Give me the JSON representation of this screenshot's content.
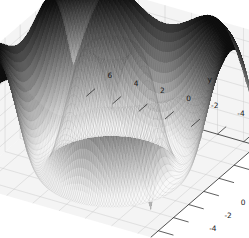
{
  "figure": {
    "name": "surface-plot-3d",
    "background_color": "#ffffff",
    "pane_color": "#f2f2f2",
    "grid_color": "#c8c8c8",
    "axis_line_color": "#1a1a1a",
    "colormap": "binary-grayscale"
  },
  "chart_data": {
    "type": "surface",
    "title": "",
    "xlabel": "x",
    "ylabel": "y",
    "zlabel": "z",
    "xlim": [
      -7,
      7
    ],
    "ylim": [
      -7,
      7
    ],
    "zlim": [
      -0.9,
      0.95
    ],
    "xticks": [
      "-6",
      "-4",
      "-2",
      "0",
      "2",
      "4",
      "6"
    ],
    "yticks": [
      "-6",
      "-4",
      "-2",
      "0",
      "2",
      "4",
      "6"
    ],
    "zticks": [
      "0.75",
      "0.50",
      "0.25",
      "0.00",
      "-0.25",
      "-0.50",
      "-0.75"
    ],
    "xtick_values": [
      -6,
      -4,
      -2,
      0,
      2,
      4,
      6
    ],
    "ytick_values": [
      -6,
      -4,
      -2,
      0,
      2,
      4,
      6
    ],
    "ztick_values": [
      0.75,
      0.5,
      0.25,
      0,
      -0.25,
      -0.5,
      -0.75
    ],
    "grid": true,
    "legend": null,
    "elevation_deg": 30,
    "azimuth_deg": -60,
    "function": "sin(sqrt(x^2 + y^2))",
    "samples": 90,
    "z_min": -0.9,
    "z_max": 0.95,
    "surface_edge_color": "#262626",
    "surface_face_low_color": "#f5f5f5",
    "surface_face_high_color": "#0d0d0d"
  },
  "labels": {
    "x_axis": "x",
    "y_axis": "y",
    "z_axis": "z"
  }
}
